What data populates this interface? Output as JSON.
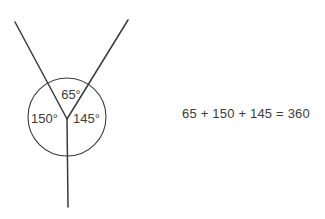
{
  "figure": {
    "background_color": "#ffffff",
    "stroke_color": "#3b3b3b",
    "text_color": "#3b3b3b",
    "vertex": {
      "x": 67,
      "y": 119
    },
    "circle": {
      "cx": 67,
      "cy": 117,
      "r": 39
    },
    "rays": [
      {
        "name": "upper-left-ray",
        "from_x": 67,
        "from_y": 119,
        "to_x": 15,
        "to_y": 22
      },
      {
        "name": "upper-right-ray",
        "from_x": 67,
        "from_y": 119,
        "to_x": 128,
        "to_y": 20
      },
      {
        "name": "downward-ray",
        "from_x": 67,
        "from_y": 119,
        "to_x": 68,
        "to_y": 207
      }
    ],
    "angles": [
      {
        "name": "top-angle",
        "label": "65°",
        "value": 65,
        "unit": "degrees",
        "x": 71,
        "y": 99
      },
      {
        "name": "left-angle",
        "label": "150°",
        "value": 150,
        "unit": "degrees",
        "x": 31,
        "y": 123
      },
      {
        "name": "right-angle",
        "label": "145°",
        "value": 145,
        "unit": "degrees",
        "x": 73,
        "y": 123
      }
    ]
  },
  "equation": {
    "text": "65 + 150 + 145 = 360",
    "terms": [
      65,
      150,
      145
    ],
    "sum": 360
  }
}
